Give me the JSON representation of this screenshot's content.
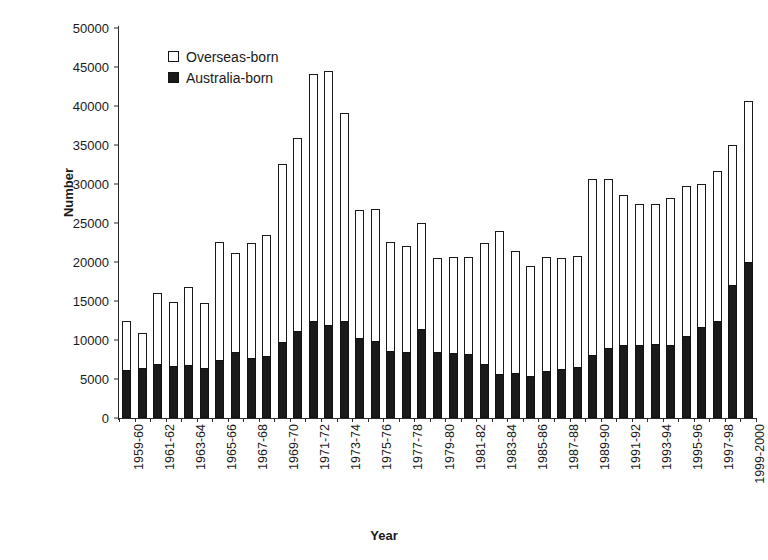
{
  "chart_data": {
    "type": "bar",
    "title": "",
    "xlabel": "Year",
    "ylabel": "Number",
    "stacked": true,
    "grid": false,
    "ylim": [
      0,
      50000
    ],
    "ytick_values": [
      50000,
      45000,
      40000,
      35000,
      30000,
      25000,
      20000,
      15000,
      10000,
      5000,
      0
    ],
    "ytick_labels": [
      "50000",
      "45000",
      "40000",
      "35000",
      "30000",
      "25000",
      "20000",
      "15000",
      "10000",
      "5000",
      "0"
    ],
    "legend_position": "upper-left-inside",
    "legend": [
      "Overseas-born",
      "Australia-born"
    ],
    "categories": [
      "1959-60",
      "1960-61",
      "1961-62",
      "1962-63",
      "1963-64",
      "1964-65",
      "1965-66",
      "1966-67",
      "1967-68",
      "1968-69",
      "1969-70",
      "1970-71",
      "1971-72",
      "1972-73",
      "1973-74",
      "1974-75",
      "1975-76",
      "1976-77",
      "1977-78",
      "1978-79",
      "1979-80",
      "1980-81",
      "1981-82",
      "1982-83",
      "1983-84",
      "1984-85",
      "1985-86",
      "1986-87",
      "1987-88",
      "1988-89",
      "1989-90",
      "1990-91",
      "1991-92",
      "1992-93",
      "1993-94",
      "1994-95",
      "1995-96",
      "1996-97",
      "1997-98",
      "1998-99",
      "1999-2000"
    ],
    "tick_label_every": 2,
    "series": [
      {
        "name": "Australia-born",
        "color": "#1a1a1a",
        "values": [
          6200,
          6400,
          6900,
          6700,
          6800,
          6400,
          7400,
          8400,
          7700,
          7900,
          9700,
          11200,
          12500,
          11900,
          12400,
          10200,
          9900,
          8600,
          8400,
          11400,
          8500,
          8300,
          8200,
          6900,
          5700,
          5800,
          5400,
          6000,
          6300,
          6500,
          8100,
          9000,
          9400,
          9400,
          9500,
          9400,
          10500,
          11700,
          12400,
          17000,
          20000
        ]
      },
      {
        "name": "Overseas-born",
        "color": "#ffffff",
        "values": [
          6300,
          4500,
          9100,
          8200,
          10000,
          8300,
          15200,
          12700,
          14800,
          15600,
          22900,
          24700,
          31600,
          32600,
          26700,
          16500,
          16900,
          14000,
          13600,
          13600,
          12000,
          12300,
          12400,
          15600,
          18300,
          15600,
          14100,
          14600,
          14200,
          14300,
          22600,
          21600,
          19200,
          18000,
          17900,
          18800,
          19200,
          18300,
          19300,
          18000,
          20700
        ]
      }
    ],
    "totals": [
      12500,
      10900,
      16000,
      14900,
      16800,
      14700,
      22600,
      21100,
      22500,
      23500,
      32600,
      35900,
      44100,
      44500,
      39100,
      26700,
      26800,
      22600,
      22000,
      25000,
      20500,
      20600,
      20600,
      22500,
      24000,
      21400,
      19500,
      20600,
      20500,
      20800,
      30700,
      30600,
      28600,
      27400,
      27400,
      28200,
      29700,
      30000,
      31700,
      35000,
      40700
    ]
  }
}
